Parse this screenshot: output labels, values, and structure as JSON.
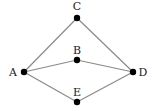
{
  "diagram": {
    "type": "graph",
    "nodes": [
      {
        "id": "A",
        "label": "A",
        "x": 24,
        "y": 72,
        "lx": 13,
        "ly": 76
      },
      {
        "id": "B",
        "label": "B",
        "x": 77,
        "y": 60,
        "lx": 77,
        "ly": 54
      },
      {
        "id": "C",
        "label": "C",
        "x": 77,
        "y": 18,
        "lx": 77,
        "ly": 10
      },
      {
        "id": "D",
        "label": "D",
        "x": 133,
        "y": 72,
        "lx": 143,
        "ly": 76
      },
      {
        "id": "E",
        "label": "E",
        "x": 77,
        "y": 102,
        "lx": 77,
        "ly": 96
      }
    ],
    "edges": [
      [
        "A",
        "C"
      ],
      [
        "C",
        "D"
      ],
      [
        "A",
        "B"
      ],
      [
        "B",
        "D"
      ],
      [
        "A",
        "E"
      ],
      [
        "E",
        "D"
      ]
    ],
    "colors": {
      "edge": "#8a8a8a",
      "node": "#000000",
      "label": "#222222"
    }
  }
}
